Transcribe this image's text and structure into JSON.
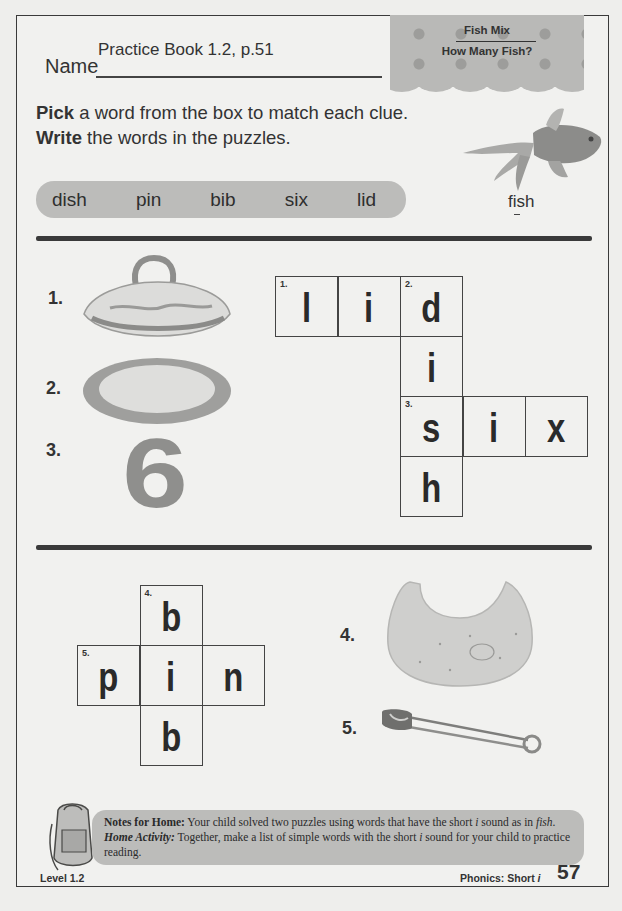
{
  "header": {
    "name_label": "Name",
    "name_value": "Practice Book 1.2, p.51",
    "banner_title": "Fish Mix",
    "banner_subtitle": "How Many Fish?"
  },
  "instructions": {
    "line1_bold": "Pick",
    "line1_rest": " a word from the box to match each clue.",
    "line2_bold": "Write",
    "line2_rest": " the words in the puzzles."
  },
  "word_box": [
    "dish",
    "pin",
    "bib",
    "six",
    "lid"
  ],
  "example": {
    "icon": "goldfish-image",
    "word_pre": "f",
    "word_underlined": "i",
    "word_post": "sh"
  },
  "puzzle1": {
    "clues": [
      {
        "number": "1.",
        "image": "covered-dish-lid-image"
      },
      {
        "number": "2.",
        "image": "dish-plate-image"
      },
      {
        "number": "3.",
        "image": "number-six-image"
      }
    ],
    "cells": [
      {
        "col": 0,
        "row": 0,
        "num": "1.",
        "letter": "l"
      },
      {
        "col": 1,
        "row": 0,
        "num": "",
        "letter": "i"
      },
      {
        "col": 2,
        "row": 0,
        "num": "2.",
        "letter": "d"
      },
      {
        "col": 2,
        "row": 1,
        "num": "",
        "letter": "i"
      },
      {
        "col": 2,
        "row": 2,
        "num": "3.",
        "letter": "s"
      },
      {
        "col": 3,
        "row": 2,
        "num": "",
        "letter": "i"
      },
      {
        "col": 4,
        "row": 2,
        "num": "",
        "letter": "x"
      },
      {
        "col": 2,
        "row": 3,
        "num": "",
        "letter": "h"
      }
    ]
  },
  "puzzle2": {
    "clues": [
      {
        "number": "4.",
        "image": "bib-image"
      },
      {
        "number": "5.",
        "image": "safety-pin-image"
      }
    ],
    "cells": [
      {
        "col": 1,
        "row": 0,
        "num": "4.",
        "letter": "b"
      },
      {
        "col": 0,
        "row": 1,
        "num": "5.",
        "letter": "p"
      },
      {
        "col": 1,
        "row": 1,
        "num": "",
        "letter": "i"
      },
      {
        "col": 2,
        "row": 1,
        "num": "",
        "letter": "n"
      },
      {
        "col": 1,
        "row": 2,
        "num": "",
        "letter": "b"
      }
    ]
  },
  "notes": {
    "icon": "backpack-icon",
    "label": "Notes for Home:",
    "text1": " Your child solved two puzzles using words that have the short ",
    "i1": "i",
    "text2": " sound as in ",
    "fish": "fish",
    "text3": ". ",
    "activity_label": "Home Activity:",
    "text4": " Together, make a list of simple words with the short ",
    "i2": "i",
    "text5": " sound for your child to practice reading."
  },
  "footer": {
    "level": "Level 1.2",
    "topic": "Phonics: Short ",
    "topic_i": "i",
    "page_number": "57"
  }
}
